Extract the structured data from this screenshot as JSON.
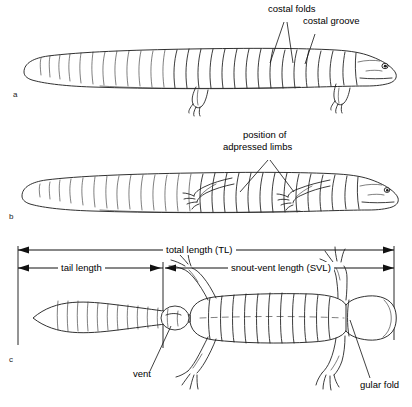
{
  "figure": {
    "panels": [
      {
        "id": "a",
        "label": "a",
        "view": "lateral view with limbs extended"
      },
      {
        "id": "b",
        "label": "b",
        "view": "lateral view with limbs adpressed"
      },
      {
        "id": "c",
        "label": "c",
        "view": "dorsal view with measurement brackets"
      }
    ],
    "annotations": [
      {
        "name": "costal-folds",
        "text": "costal folds",
        "panel": "a"
      },
      {
        "name": "costal-groove",
        "text": "costal groove",
        "panel": "a"
      },
      {
        "name": "adpressed-limbs",
        "text": "position of\nadpressed limbs",
        "line1": "position of",
        "line2": "adpressed limbs",
        "panel": "b"
      },
      {
        "name": "vent",
        "text": "vent",
        "panel": "c"
      },
      {
        "name": "gular-fold",
        "text": "gular fold",
        "panel": "c"
      }
    ],
    "measurements": [
      {
        "name": "total-length",
        "label": "total length (TL)",
        "abbr": "TL",
        "span": "snout tip to tail tip"
      },
      {
        "name": "tail-length",
        "label": "tail length",
        "abbr": "",
        "span": "vent to tail tip"
      },
      {
        "name": "snout-vent-length",
        "label": "snout-vent length (SVL)",
        "abbr": "SVL",
        "span": "snout tip to vent"
      }
    ],
    "colors": {
      "ink": "#1a1a1a",
      "background": "#ffffff",
      "text": "#000000"
    }
  }
}
